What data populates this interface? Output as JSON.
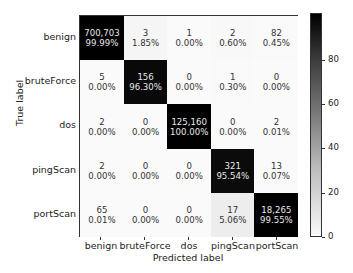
{
  "chart_data": {
    "type": "heatmap",
    "title": "",
    "xlabel": "Predicted label",
    "ylabel": "True label",
    "x_categories": [
      "benign",
      "bruteForce",
      "dos",
      "pingScan",
      "portScan"
    ],
    "y_categories": [
      "benign",
      "bruteForce",
      "dos",
      "pingScan",
      "portScan"
    ],
    "counts": [
      [
        "700,703",
        "3",
        "1",
        "2",
        "82"
      ],
      [
        "5",
        "156",
        "0",
        "1",
        "0"
      ],
      [
        "2",
        "0",
        "125,160",
        "0",
        "2"
      ],
      [
        "2",
        "0",
        "0",
        "321",
        "13"
      ],
      [
        "65",
        "0",
        "0",
        "17",
        "18,265"
      ]
    ],
    "percentages": [
      [
        "99.99%",
        "1.85%",
        "0.00%",
        "0.60%",
        "0.45%"
      ],
      [
        "0.00%",
        "96.30%",
        "0.00%",
        "0.30%",
        "0.00%"
      ],
      [
        "0.00%",
        "0.00%",
        "100.00%",
        "0.00%",
        "0.01%"
      ],
      [
        "0.00%",
        "0.00%",
        "0.00%",
        "95.54%",
        "0.07%"
      ],
      [
        "0.01%",
        "0.00%",
        "0.00%",
        "5.06%",
        "99.55%"
      ]
    ],
    "values": [
      [
        99.99,
        1.85,
        0.0,
        0.6,
        0.45
      ],
      [
        0.0,
        96.3,
        0.0,
        0.3,
        0.0
      ],
      [
        0.0,
        0.0,
        100.0,
        0.0,
        0.01
      ],
      [
        0.0,
        0.0,
        0.0,
        95.54,
        0.07
      ],
      [
        0.01,
        0.0,
        0.0,
        5.06,
        99.55
      ]
    ],
    "colorbar": {
      "ticks": [
        "0",
        "20",
        "40",
        "60",
        "80"
      ],
      "range": [
        0,
        100
      ],
      "colormap": "Greys"
    },
    "grid": false,
    "legend": "colorbar-right"
  }
}
